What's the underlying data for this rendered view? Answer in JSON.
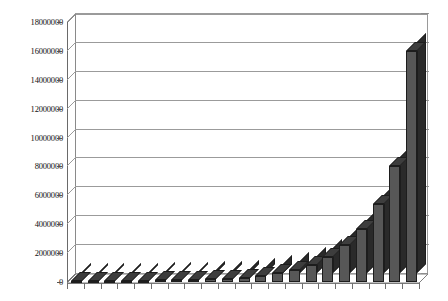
{
  "chart_data": {
    "type": "bar",
    "title": "",
    "subtitle": "",
    "xlabel": "",
    "ylabel": "",
    "grid": true,
    "legend": false,
    "legend_position": "none",
    "style": "3d-column",
    "ylim": [
      0,
      18000000
    ],
    "ytick_labels": [
      "18000000",
      "16000000",
      "14000000",
      "12000000",
      "10000000",
      "8000000",
      "6000000",
      "4000000",
      "2000000",
      "0"
    ],
    "ytick_values": [
      18000000,
      16000000,
      14000000,
      12000000,
      10000000,
      8000000,
      6000000,
      4000000,
      2000000,
      0
    ],
    "xtick_labels": [
      "",
      "",
      "",
      "",
      "",
      "",
      "",
      "",
      "",
      "",
      "",
      "",
      "",
      "",
      "",
      "",
      "",
      "",
      "",
      "",
      ""
    ],
    "categories": [
      "1",
      "2",
      "3",
      "4",
      "5",
      "6",
      "7",
      "8",
      "9",
      "10",
      "11",
      "12",
      "13",
      "14",
      "15",
      "16",
      "17",
      "18",
      "19",
      "20",
      "21"
    ],
    "values": [
      60000,
      70000,
      80000,
      90000,
      100000,
      110000,
      130000,
      150000,
      180000,
      230000,
      300000,
      420000,
      600000,
      850000,
      1200000,
      1750000,
      2550000,
      3700000,
      5400000,
      8000000,
      16000000
    ],
    "series": [
      {
        "name": "Series 1",
        "color": "#4d4d4d",
        "values": [
          60000,
          70000,
          80000,
          90000,
          100000,
          110000,
          130000,
          150000,
          180000,
          230000,
          300000,
          420000,
          600000,
          850000,
          1200000,
          1750000,
          2550000,
          3700000,
          5400000,
          8000000,
          16000000
        ]
      }
    ],
    "colors": {
      "bar_face": "#575757",
      "bar_side": "#2a2a2a",
      "bar_top": "#3d3d3d",
      "bar_outline": "#1d1d1d",
      "gridline": "#9b9b9b",
      "axis": "#6f6f6f",
      "plot_background": "#ffffff",
      "page_background": "#ffffff",
      "label_text": "#111111"
    }
  }
}
